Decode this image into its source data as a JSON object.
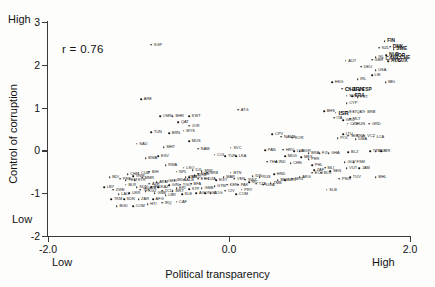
{
  "figure": {
    "background": "#fdfdfc",
    "ink_color": "#1a1a1a"
  },
  "annotations": {
    "correlation": "r = 0.76",
    "y_anchor_high": "High",
    "y_anchor_low": "Low",
    "x_anchor_low": "Low",
    "x_anchor_high": "High"
  },
  "chart_data": {
    "type": "scatter",
    "title": "",
    "xlabel": "Political transparency",
    "ylabel": "Control of corruption",
    "xlim": [
      -2.0,
      2.0
    ],
    "ylim": [
      -2,
      3
    ],
    "xticks": [
      "-2.0",
      "0.0",
      "2.0"
    ],
    "xtick_values": [
      -2.0,
      0.0,
      2.0
    ],
    "yticks": [
      "3",
      "2",
      "1",
      "0",
      "-1",
      "-2"
    ],
    "ytick_values": [
      3,
      2,
      1,
      0,
      -1,
      -2
    ],
    "grid": false,
    "legend": false,
    "correlation_r": 0.76,
    "point_label_type": "iso3-country-code",
    "n_points": 182,
    "points": [
      {
        "label": "SGP",
        "x": -0.86,
        "y": 2.47
      },
      {
        "label": "FIN",
        "x": 1.72,
        "y": 2.55
      },
      {
        "label": "DNK",
        "x": 1.78,
        "y": 2.42
      },
      {
        "label": "NZL",
        "x": 1.66,
        "y": 2.4
      },
      {
        "label": "SWE",
        "x": 1.82,
        "y": 2.36
      },
      {
        "label": "NLD",
        "x": 1.74,
        "y": 2.22
      },
      {
        "label": "NOR",
        "x": 1.8,
        "y": 2.2
      },
      {
        "label": "CHE",
        "x": 1.86,
        "y": 2.16
      },
      {
        "label": "CAN",
        "x": 1.7,
        "y": 2.14
      },
      {
        "label": "ISL",
        "x": 1.62,
        "y": 2.18
      },
      {
        "label": "LUX",
        "x": 1.84,
        "y": 2.1
      },
      {
        "label": "AUS",
        "x": 1.76,
        "y": 2.08
      },
      {
        "label": "GBR",
        "x": 1.58,
        "y": 2.12
      },
      {
        "label": "AUT",
        "x": 1.29,
        "y": 2.1
      },
      {
        "label": "DEU",
        "x": 1.46,
        "y": 1.96
      },
      {
        "label": "USA",
        "x": 1.62,
        "y": 1.88
      },
      {
        "label": "LIE",
        "x": 1.58,
        "y": 1.76
      },
      {
        "label": "IRL",
        "x": 1.42,
        "y": 1.66
      },
      {
        "label": "BEL",
        "x": 1.73,
        "y": 1.6
      },
      {
        "label": "HKG",
        "x": 1.14,
        "y": 1.6
      },
      {
        "label": "CHL",
        "x": 1.25,
        "y": 1.44
      },
      {
        "label": "JPN",
        "x": 1.33,
        "y": 1.44
      },
      {
        "label": "ESP",
        "x": 1.44,
        "y": 1.4
      },
      {
        "label": "SVN",
        "x": 1.3,
        "y": 1.28
      },
      {
        "label": "FRA",
        "x": 1.36,
        "y": 1.26
      },
      {
        "label": "PRT",
        "x": 1.42,
        "y": 1.24
      },
      {
        "label": "CYP",
        "x": 1.3,
        "y": 1.1
      },
      {
        "label": "ATG",
        "x": 0.1,
        "y": 0.95
      },
      {
        "label": "BHS",
        "x": 1.05,
        "y": 0.92
      },
      {
        "label": "ISR",
        "x": 1.18,
        "y": 0.88
      },
      {
        "label": "EST",
        "x": 1.3,
        "y": 0.9
      },
      {
        "label": "QAT2",
        "x": 1.38,
        "y": 0.9
      },
      {
        "label": "BRB",
        "x": 1.5,
        "y": 0.9
      },
      {
        "label": "ITA",
        "x": 1.16,
        "y": 0.76
      },
      {
        "label": "GRC",
        "x": 1.26,
        "y": 0.7
      },
      {
        "label": "MLT",
        "x": 1.34,
        "y": 0.74
      },
      {
        "label": "CZE",
        "x": 1.31,
        "y": 0.62
      },
      {
        "label": "HUN",
        "x": 1.38,
        "y": 0.62
      },
      {
        "label": "GRD",
        "x": 1.55,
        "y": 0.62
      },
      {
        "label": "ARE",
        "x": -0.97,
        "y": 1.2
      },
      {
        "label": "OMN",
        "x": -0.76,
        "y": 0.8
      },
      {
        "label": "BHR",
        "x": -0.62,
        "y": 0.8
      },
      {
        "label": "KWT",
        "x": -0.44,
        "y": 0.8
      },
      {
        "label": "QAT",
        "x": -0.56,
        "y": 0.66
      },
      {
        "label": "JOR",
        "x": -0.44,
        "y": 0.58
      },
      {
        "label": "TUN",
        "x": -0.86,
        "y": 0.42
      },
      {
        "label": "BRN",
        "x": -0.66,
        "y": 0.4
      },
      {
        "label": "MYS",
        "x": -0.5,
        "y": 0.46
      },
      {
        "label": "SAU",
        "x": -1.02,
        "y": 0.16
      },
      {
        "label": "MHT",
        "x": -0.72,
        "y": 0.08
      },
      {
        "label": "MUS",
        "x": -0.44,
        "y": 0.22
      },
      {
        "label": "NAM",
        "x": -0.34,
        "y": 0.04
      },
      {
        "label": "CPV",
        "x": 0.48,
        "y": 0.38
      },
      {
        "label": "NAMB",
        "x": 0.58,
        "y": 0.32
      },
      {
        "label": "KOR",
        "x": 0.7,
        "y": 0.3
      },
      {
        "label": "POL",
        "x": 1.2,
        "y": 0.28
      },
      {
        "label": "LTU",
        "x": 1.26,
        "y": 0.38
      },
      {
        "label": "SVK",
        "x": 1.32,
        "y": 0.34
      },
      {
        "label": "KNA",
        "x": 1.38,
        "y": 0.34
      },
      {
        "label": "DMA",
        "x": 1.4,
        "y": 0.26
      },
      {
        "label": "VCT",
        "x": 1.5,
        "y": 0.34
      },
      {
        "label": "LCA",
        "x": 1.6,
        "y": 0.32
      },
      {
        "label": "SVC",
        "x": 0.02,
        "y": 0.06
      },
      {
        "label": "HRV",
        "x": 0.6,
        "y": 0.02
      },
      {
        "label": "LVA",
        "x": 0.72,
        "y": -0.02
      },
      {
        "label": "BGR",
        "x": 0.78,
        "y": -0.02
      },
      {
        "label": "BRA",
        "x": 0.88,
        "y": -0.06
      },
      {
        "label": "FJI",
        "x": 1.0,
        "y": -0.06
      },
      {
        "label": "GHA",
        "x": 1.1,
        "y": -0.06
      },
      {
        "label": "BLZ",
        "x": 1.32,
        "y": -0.04
      },
      {
        "label": "TTO",
        "x": 1.56,
        "y": -0.02
      },
      {
        "label": "MDV",
        "x": 1.62,
        "y": -0.02
      },
      {
        "label": "KIR",
        "x": 1.68,
        "y": -0.02
      },
      {
        "label": "PAN",
        "x": 0.4,
        "y": 0.0
      },
      {
        "label": "COL",
        "x": -0.16,
        "y": -0.1
      },
      {
        "label": "TUR",
        "x": -0.04,
        "y": -0.14
      },
      {
        "label": "LKA",
        "x": 0.08,
        "y": -0.14
      },
      {
        "label": "ESV",
        "x": -0.78,
        "y": -0.14
      },
      {
        "label": "RWA",
        "x": -0.7,
        "y": -0.34
      },
      {
        "label": "MDG",
        "x": 0.62,
        "y": -0.14
      },
      {
        "label": "MEX",
        "x": 0.8,
        "y": -0.16
      },
      {
        "label": "PER",
        "x": 0.88,
        "y": -0.2
      },
      {
        "label": "THA",
        "x": 0.42,
        "y": -0.26
      },
      {
        "label": "IND",
        "x": 0.52,
        "y": -0.26
      },
      {
        "label": "CHN",
        "x": 0.68,
        "y": -0.3
      },
      {
        "label": "PHL",
        "x": 0.92,
        "y": -0.34
      },
      {
        "label": "MLI",
        "x": 1.06,
        "y": -0.4
      },
      {
        "label": "SEN",
        "x": 1.12,
        "y": -0.48
      },
      {
        "label": "VUT",
        "x": 1.3,
        "y": -0.42
      },
      {
        "label": "JAM",
        "x": 1.44,
        "y": -0.42
      },
      {
        "label": "GUY",
        "x": 1.28,
        "y": -0.28
      },
      {
        "label": "FSM",
        "x": 1.38,
        "y": -0.28
      },
      {
        "label": "ECU",
        "x": 0.92,
        "y": -0.52
      },
      {
        "label": "BOL",
        "x": 1.02,
        "y": -0.52
      },
      {
        "label": "TUV",
        "x": 1.34,
        "y": -0.62
      },
      {
        "label": "PNG",
        "x": 1.22,
        "y": -0.66
      },
      {
        "label": "MHL",
        "x": 1.62,
        "y": -0.62
      },
      {
        "label": "SLB",
        "x": 1.08,
        "y": -0.92
      },
      {
        "label": "LSO",
        "x": -0.5,
        "y": -0.4
      },
      {
        "label": "DJI",
        "x": -0.4,
        "y": -0.46
      },
      {
        "label": "NPL",
        "x": -0.58,
        "y": -0.5
      },
      {
        "label": "MWI",
        "x": -0.3,
        "y": -0.48
      },
      {
        "label": "BDI",
        "x": -1.32,
        "y": -0.62
      },
      {
        "label": "CHN2",
        "x": -1.12,
        "y": -0.56
      },
      {
        "label": "VNM",
        "x": -1.06,
        "y": -0.6
      },
      {
        "label": "YEM",
        "x": -1.14,
        "y": -0.7
      },
      {
        "label": "SYR",
        "x": -1.04,
        "y": -0.7
      },
      {
        "label": "LBY",
        "x": -1.38,
        "y": -0.86
      },
      {
        "label": "ZWE",
        "x": -1.28,
        "y": -0.92
      },
      {
        "label": "BLR",
        "x": -1.14,
        "y": -0.8
      },
      {
        "label": "SDN2",
        "x": -1.02,
        "y": -0.86
      },
      {
        "label": "UZB",
        "x": -0.92,
        "y": -0.88
      },
      {
        "label": "IRN",
        "x": -0.86,
        "y": -0.86
      },
      {
        "label": "KAZ",
        "x": -0.78,
        "y": -0.86
      },
      {
        "label": "LAO",
        "x": -1.22,
        "y": -1.02
      },
      {
        "label": "UKR",
        "x": -1.1,
        "y": -1.0
      },
      {
        "label": "TKM",
        "x": -1.3,
        "y": -1.14
      },
      {
        "label": "SDN",
        "x": -1.16,
        "y": -1.14
      },
      {
        "label": "ZAR",
        "x": -1.0,
        "y": -1.14
      },
      {
        "label": "AFG",
        "x": -0.84,
        "y": -1.14
      },
      {
        "label": "BGD",
        "x": -1.24,
        "y": -1.3
      },
      {
        "label": "COM2",
        "x": -1.06,
        "y": -1.3
      },
      {
        "label": "HTI",
        "x": -0.9,
        "y": -1.26
      },
      {
        "label": "IRQ",
        "x": -0.74,
        "y": -1.22
      },
      {
        "label": "CAF",
        "x": -0.58,
        "y": -1.2
      },
      {
        "label": "COM",
        "x": 0.08,
        "y": -1.02
      },
      {
        "label": "PRY",
        "x": 0.14,
        "y": -0.92
      },
      {
        "label": "NGA",
        "x": -0.26,
        "y": -1.0
      },
      {
        "label": "CIV",
        "x": -0.04,
        "y": -0.94
      },
      {
        "label": "GTM",
        "x": -0.16,
        "y": -0.84
      },
      {
        "label": "KEN",
        "x": -0.02,
        "y": -0.8
      },
      {
        "label": "PAK",
        "x": 0.1,
        "y": -0.8
      },
      {
        "label": "NIC",
        "x": 0.22,
        "y": -0.74
      },
      {
        "label": "TZA",
        "x": 0.3,
        "y": -0.78
      },
      {
        "label": "UGA",
        "x": 0.38,
        "y": -0.8
      },
      {
        "label": "ZMB",
        "x": 0.46,
        "y": -0.76
      },
      {
        "label": "BEN",
        "x": 0.54,
        "y": -0.7
      },
      {
        "label": "NER",
        "x": 0.62,
        "y": -0.7
      },
      {
        "label": "MOZ",
        "x": 0.7,
        "y": -0.66
      },
      {
        "label": "ARG",
        "x": 0.78,
        "y": -0.62
      },
      {
        "label": "HND",
        "x": 0.5,
        "y": -0.56
      },
      {
        "label": "RUS",
        "x": 0.34,
        "y": -0.62
      },
      {
        "label": "IDN",
        "x": 0.26,
        "y": -0.6
      },
      {
        "label": "ETH",
        "x": -0.34,
        "y": -0.66
      },
      {
        "label": "CMR",
        "x": -0.48,
        "y": -0.62
      },
      {
        "label": "BFA",
        "x": -0.42,
        "y": -0.78
      },
      {
        "label": "TGO",
        "x": -0.54,
        "y": -0.8
      },
      {
        "label": "GIN",
        "x": -0.66,
        "y": -0.82
      },
      {
        "label": "TCD",
        "x": -0.74,
        "y": -0.94
      },
      {
        "label": "MRT",
        "x": -0.62,
        "y": -0.96
      },
      {
        "label": "AGO",
        "x": -0.36,
        "y": -1.0
      },
      {
        "label": "COG",
        "x": -0.2,
        "y": -1.0
      },
      {
        "label": "SLE",
        "x": -0.52,
        "y": -1.02
      },
      {
        "label": "LBR",
        "x": -0.7,
        "y": -1.04
      },
      {
        "label": "GNB",
        "x": -0.82,
        "y": -1.0
      },
      {
        "label": "KGZ",
        "x": -0.92,
        "y": -0.96
      },
      {
        "label": "TJK",
        "x": -0.98,
        "y": -0.92
      },
      {
        "label": "AZE",
        "x": -0.88,
        "y": -0.78
      },
      {
        "label": "ARM",
        "x": -0.8,
        "y": -0.74
      },
      {
        "label": "GEO",
        "x": -0.7,
        "y": -0.72
      },
      {
        "label": "MDA",
        "x": -0.6,
        "y": -0.7
      },
      {
        "label": "ALB",
        "x": -0.5,
        "y": -0.68
      },
      {
        "label": "MKD",
        "x": -0.44,
        "y": -0.62
      },
      {
        "label": "ROM",
        "x": -0.38,
        "y": -0.58
      },
      {
        "label": "DZA",
        "x": -0.26,
        "y": -0.66
      },
      {
        "label": "EGY",
        "x": -0.14,
        "y": -0.7
      },
      {
        "label": "MAR",
        "x": -0.06,
        "y": -0.62
      },
      {
        "label": "VEN",
        "x": 0.06,
        "y": -0.66
      },
      {
        "label": "SWZ",
        "x": 0.18,
        "y": -0.68
      },
      {
        "label": "GMB",
        "x": -0.3,
        "y": -0.88
      },
      {
        "label": "STP",
        "x": -0.44,
        "y": -0.9
      },
      {
        "label": "ERI",
        "x": -0.58,
        "y": -0.88
      },
      {
        "label": "MMR",
        "x": -0.96,
        "y": -0.64
      },
      {
        "label": "PRK",
        "x": -1.2,
        "y": -0.66
      },
      {
        "label": "CUB",
        "x": -1.0,
        "y": -0.52
      },
      {
        "label": "BWA",
        "x": -0.92,
        "y": -0.18
      },
      {
        "label": "BIH",
        "x": -0.88,
        "y": -0.5
      },
      {
        "label": "KHM",
        "x": -0.34,
        "y": -0.54
      },
      {
        "label": "SRB",
        "x": -0.24,
        "y": -0.52
      },
      {
        "label": "ZAF",
        "x": 0.94,
        "y": -0.46
      },
      {
        "label": "BTN",
        "x": 0.02,
        "y": -0.52
      }
    ]
  }
}
